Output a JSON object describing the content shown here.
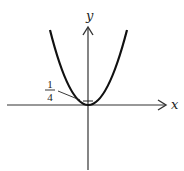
{
  "diagram": {
    "type": "function-graph",
    "axes": {
      "x_label": "x",
      "y_label": "y"
    },
    "annotation": {
      "numerator": "1",
      "denominator": "4",
      "target": "vertex offset above origin"
    },
    "colors": {
      "curve": "#111111",
      "axes": "#333333",
      "background": "#ffffff"
    }
  }
}
